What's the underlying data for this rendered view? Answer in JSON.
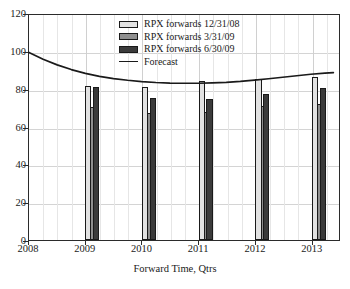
{
  "chart_data": {
    "type": "bar",
    "title": "",
    "xlabel": "Forward Time, Qtrs",
    "ylabel": "",
    "categories": [
      "2008",
      "2009",
      "2010",
      "2011",
      "2012",
      "2013"
    ],
    "xlim": [
      2008,
      2013.5
    ],
    "ylim": [
      0,
      120
    ],
    "yticks": [
      0,
      20,
      40,
      60,
      80,
      100,
      120
    ],
    "grid": true,
    "legend_position": "upper-center",
    "series": [
      {
        "name": "RPX forwards 12/31/08",
        "color": "#e2e2e2",
        "values": [
          null,
          81.5,
          81.0,
          84.0,
          85.0,
          86.0
        ]
      },
      {
        "name": "RPX forwards 3/31/09",
        "color": "#8f8f8f",
        "values": [
          null,
          70.5,
          67.0,
          67.5,
          71.0,
          72.0
        ]
      },
      {
        "name": "RPX forwards 6/30/09",
        "color": "#3b3b3b",
        "values": [
          null,
          80.8,
          75.3,
          74.3,
          77.0,
          80.3
        ]
      }
    ],
    "line_series": [
      {
        "name": "Forecast",
        "color": "#1a1a1a",
        "points": [
          [
            2008.0,
            100.0
          ],
          [
            2008.25,
            96.4
          ],
          [
            2008.5,
            93.4
          ],
          [
            2008.75,
            90.9
          ],
          [
            2009.0,
            88.9
          ],
          [
            2009.25,
            87.3
          ],
          [
            2009.5,
            86.1
          ],
          [
            2009.75,
            85.2
          ],
          [
            2010.0,
            84.5
          ],
          [
            2010.25,
            84.0
          ],
          [
            2010.5,
            83.7
          ],
          [
            2010.75,
            83.6
          ],
          [
            2011.0,
            83.6
          ],
          [
            2011.25,
            83.8
          ],
          [
            2011.5,
            84.1
          ],
          [
            2011.75,
            84.6
          ],
          [
            2012.0,
            85.3
          ],
          [
            2012.25,
            86.0
          ],
          [
            2012.5,
            86.8
          ],
          [
            2012.75,
            87.6
          ],
          [
            2013.0,
            88.4
          ],
          [
            2013.25,
            89.0
          ],
          [
            2013.4,
            89.3
          ]
        ]
      }
    ],
    "legend_entries": [
      {
        "label": "RPX forwards 12/31/08",
        "type": "swatch",
        "swatch_class": "sw0"
      },
      {
        "label": "RPX forwards 3/31/09",
        "type": "swatch",
        "swatch_class": "sw1"
      },
      {
        "label": "RPX forwards 6/30/09",
        "type": "swatch",
        "swatch_class": "sw2"
      },
      {
        "label": "Forecast",
        "type": "line",
        "swatch_class": ""
      }
    ]
  },
  "axes": {
    "y_tick_labels": [
      "0",
      "20",
      "40",
      "60",
      "80",
      "100",
      "120"
    ],
    "x_tick_labels": [
      "2008",
      "2009",
      "2010",
      "2011",
      "2012",
      "2013"
    ],
    "x_axis_title": "Forward Time, Qtrs"
  }
}
